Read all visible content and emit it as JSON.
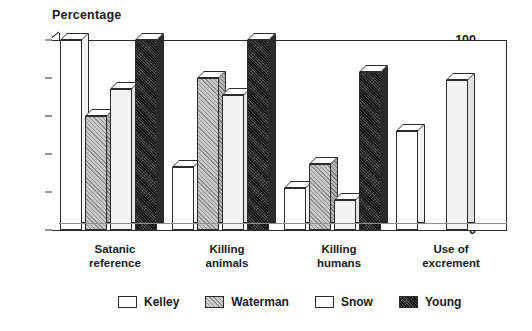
{
  "chart_data": {
    "type": "bar",
    "title": "Percentage",
    "xlabel": "",
    "ylabel": "Percentage",
    "ylim": [
      0,
      100
    ],
    "yticks": [
      0,
      20,
      40,
      60,
      80,
      100
    ],
    "grid": false,
    "legend_position": "bottom",
    "categories": [
      "Satanic\nreference",
      "Killing\nanimals",
      "Killing\nhumans",
      "Use of\nexcrement"
    ],
    "series": [
      {
        "name": "Kelley",
        "values": [
          100,
          33,
          22,
          52
        ]
      },
      {
        "name": "Waterman",
        "values": [
          60,
          80,
          35,
          0
        ]
      },
      {
        "name": "Snow",
        "values": [
          74,
          71,
          16,
          79
        ]
      },
      {
        "name": "Young",
        "values": [
          100,
          100,
          83,
          0
        ]
      }
    ]
  },
  "axis": {
    "title": "Percentage",
    "tick_100": "100",
    "tick_80": "80",
    "tick_60": "60",
    "tick_40": "40",
    "tick_20": "20",
    "tick_0": "0"
  },
  "categories": {
    "c0": "Satanic\nreference",
    "c1": "Killing\nanimals",
    "c2": "Killing\nhumans",
    "c3": "Use of\nexcrement"
  },
  "legend": {
    "items": [
      {
        "label": "Kelley",
        "swatch": "white-swatch"
      },
      {
        "label": "Waterman",
        "swatch": "hatched-swatch"
      },
      {
        "label": "Snow",
        "swatch": "light-swatch"
      },
      {
        "label": "Young",
        "swatch": "dark-swatch"
      }
    ]
  },
  "colors": {
    "axis": "#2b2b2b",
    "kelley": "#ffffff",
    "waterman": "#c9c9c9",
    "snow": "#f2f2f2",
    "young": "#3a3a3a"
  }
}
